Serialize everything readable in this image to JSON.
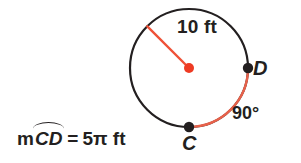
{
  "figure": {
    "colors": {
      "circle_stroke": "#231f20",
      "arc_highlight": "#e8614a",
      "radius_line": "#ef5137",
      "center_dot": "#ee3b23",
      "point_dot": "#231f20",
      "text": "#231f20",
      "background": "#ffffff"
    },
    "geometry": {
      "center_x": 189,
      "center_y": 68,
      "radius_px": 59,
      "arc_start_angle_deg": 90,
      "arc_end_angle_deg": 0,
      "arc_sweep_deg": 90,
      "radius_line_angle_deg": 135
    },
    "radius_label": "10 ft",
    "angle_label": "90°",
    "points": [
      {
        "name": "point-c",
        "label": "C",
        "angle_deg": 270
      },
      {
        "name": "point-d",
        "label": "D",
        "angle_deg": 0
      }
    ],
    "equation": {
      "measure_prefix": "m",
      "arc_name": "CD",
      "equals": "=",
      "value": "5π ft",
      "full_text": "mCD = 5π ft"
    }
  }
}
